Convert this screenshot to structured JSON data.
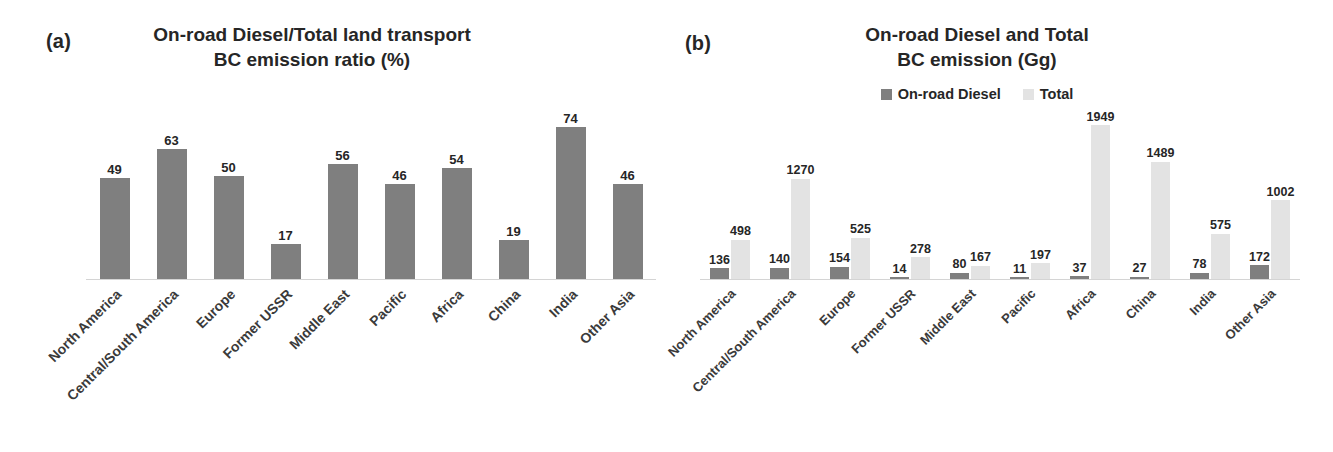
{
  "figure": {
    "panels": [
      {
        "tag": "(a)",
        "title": "On-road Diesel/Total land transport BC emission ratio (%)",
        "title_line1": "On-road Diesel/Total land transport",
        "title_line2": "BC emission ratio (%)"
      },
      {
        "tag": "(b)",
        "title": "On-road Diesel and Total BC emission (Gg)",
        "title_line1": "On-road Diesel and Total",
        "title_line2": "BC emission (Gg)",
        "legend": [
          {
            "label": "On-road Diesel",
            "color": "#7f7f7f"
          },
          {
            "label": "Total",
            "color": "#e3e3e3"
          }
        ]
      }
    ]
  },
  "colors": {
    "dark_bar": "#7f7f7f",
    "light_bar": "#e3e3e3",
    "axis": "#d4d4d4",
    "text": "#262626"
  },
  "chart_data": [
    {
      "type": "bar",
      "panel": "a",
      "title": "On-road Diesel/Total land transport BC emission ratio (%)",
      "xlabel": "",
      "ylabel": "",
      "ylim": [
        0,
        80
      ],
      "grid": false,
      "legend_position": "none",
      "categories": [
        "North America",
        "Central/South America",
        "Europe",
        "Former USSR",
        "Middle East",
        "Pacific",
        "Africa",
        "China",
        "India",
        "Other Asia"
      ],
      "series": [
        {
          "name": "On-road Diesel/Total land transport BC emission ratio (%)",
          "color": "#7f7f7f",
          "values": [
            49,
            63,
            50,
            17,
            56,
            46,
            54,
            19,
            74,
            46
          ]
        }
      ]
    },
    {
      "type": "bar",
      "panel": "b",
      "title": "On-road Diesel and Total BC emission (Gg)",
      "xlabel": "",
      "ylabel": "",
      "ylim": [
        0,
        2000
      ],
      "grid": false,
      "legend_position": "top",
      "categories": [
        "North America",
        "Central/South America",
        "Europe",
        "Former USSR",
        "Middle East",
        "Pacific",
        "Africa",
        "China",
        "India",
        "Other Asia"
      ],
      "series": [
        {
          "name": "On-road Diesel",
          "color": "#7f7f7f",
          "values": [
            136,
            140,
            154,
            14,
            80,
            11,
            37,
            27,
            78,
            172
          ]
        },
        {
          "name": "Total",
          "color": "#e3e3e3",
          "values": [
            498,
            1270,
            525,
            278,
            167,
            197,
            1949,
            1489,
            575,
            1002
          ]
        }
      ]
    }
  ]
}
